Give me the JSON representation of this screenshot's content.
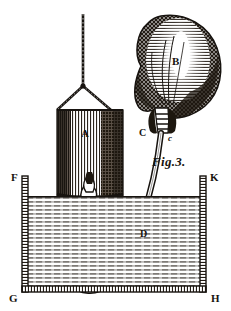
{
  "figure": {
    "caption": "Fig.3.",
    "domain_kind": "engraving-diagram",
    "background_color": "#ffffff",
    "ink_color": "#17130f",
    "width": 231,
    "height": 311
  },
  "labels": {
    "balloon": "B",
    "cylinder": "A",
    "neck_left": "C",
    "neck_right": "c",
    "vessel_top_left": "F",
    "vessel_top_right": "K",
    "vessel_bottom_left": "G",
    "vessel_bottom_right": "H",
    "tube_mid": "D"
  },
  "parts": {
    "suspension_cord": "suspension-cord",
    "sling": "sling-yoke",
    "cylinder": "hatched-cylinder-A",
    "bladder": "inflated-bladder-B",
    "neck": "bladder-neck-Cc",
    "tube": "curved-tube-D",
    "collar": "tube-collar",
    "vessel": "open-vessel-FKGH",
    "liquid": "liquid-bath"
  }
}
